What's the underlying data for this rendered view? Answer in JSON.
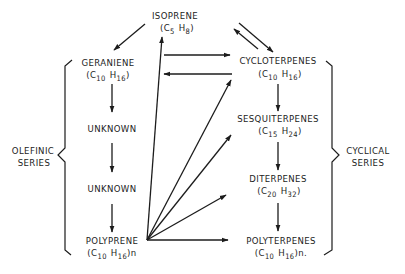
{
  "nodes": {
    "isoprene": {
      "name": "ISOPRENE",
      "formula_open": "(C",
      "c": "5",
      "h_label": "H",
      "h": "8",
      "formula_close": ")"
    },
    "geraniene": {
      "name": "GERANIENE",
      "formula_open": "(C",
      "c": "10",
      "h_label": "H",
      "h": "16",
      "formula_close": ")"
    },
    "unknown1": {
      "name": "UNKNOWN"
    },
    "unknown2": {
      "name": "UNKNOWN"
    },
    "polyprene": {
      "name": "POLYPRENE",
      "formula_open": "(C",
      "c": "10",
      "h_label": "H",
      "h": "16",
      "formula_close": ")n"
    },
    "cycloterpenes": {
      "name": "CYCLOTERPENES",
      "formula_open": "(C",
      "c": "10",
      "h_label": "H",
      "h": "16",
      "formula_close": ")"
    },
    "sesquiterpenes": {
      "name": "SESQUITERPENES",
      "formula_open": "(C",
      "c": "15",
      "h_label": "H",
      "h": "24",
      "formula_close": ")"
    },
    "diterpenes": {
      "name": "DITERPENES",
      "formula_open": "(C",
      "c": "20",
      "h_label": "H",
      "h": "32",
      "formula_close": ")"
    },
    "polyterpenes": {
      "name": "POLYTERPENES",
      "formula_open": "(C",
      "c": "10",
      "h_label": "H",
      "h": "16",
      "formula_close": ")n."
    }
  },
  "groups": {
    "olefinic": {
      "line1": "OLEFINIC",
      "line2": "SERIES",
      "members": [
        "geraniene",
        "unknown1",
        "unknown2",
        "polyprene"
      ]
    },
    "cyclical": {
      "line1": "CYCLICAL",
      "line2": "SERIES",
      "members": [
        "cycloterpenes",
        "sesquiterpenes",
        "diterpenes",
        "polyterpenes"
      ]
    }
  },
  "edges": [
    {
      "from": "isoprene",
      "to": "geraniene"
    },
    {
      "from": "isoprene",
      "to": "cycloterpenes"
    },
    {
      "from": "cycloterpenes",
      "to": "isoprene"
    },
    {
      "from": "geraniene",
      "to": "unknown1"
    },
    {
      "from": "unknown1",
      "to": "unknown2"
    },
    {
      "from": "unknown2",
      "to": "polyprene"
    },
    {
      "from": "geraniene",
      "to": "cycloterpenes"
    },
    {
      "from": "cycloterpenes",
      "to": "geraniene"
    },
    {
      "from": "cycloterpenes",
      "to": "sesquiterpenes"
    },
    {
      "from": "sesquiterpenes",
      "to": "diterpenes"
    },
    {
      "from": "diterpenes",
      "to": "polyterpenes"
    },
    {
      "from": "polyprene",
      "to": "isoprene"
    },
    {
      "from": "polyprene",
      "to": "cycloterpenes"
    },
    {
      "from": "polyprene",
      "to": "sesquiterpenes"
    },
    {
      "from": "polyprene",
      "to": "diterpenes"
    },
    {
      "from": "polyprene",
      "to": "polyterpenes"
    }
  ],
  "colors": {
    "ink": "#1c1c1c",
    "paper": "#ffffff"
  }
}
